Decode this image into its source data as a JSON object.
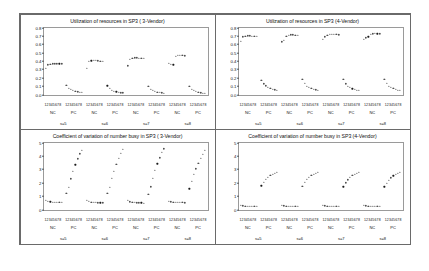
{
  "figure": {
    "background": "#ffffff",
    "frame_color": "#6a6a6a",
    "marker_color": "#1a1a1a"
  },
  "chart_data": [
    {
      "id": "top-left",
      "type": "scatter",
      "title": "Utilization of resources in SP3 ( 3-Vendor)",
      "xlabel": "",
      "ylabel": "",
      "ylim": [
        0.0,
        0.8
      ],
      "yticks": [
        "0.0",
        "0.1",
        "0.2",
        "0.3",
        "0.4",
        "0.5",
        "0.6",
        "0.7",
        "0.8"
      ],
      "grid": false,
      "legend": "none",
      "x_tick_labels": [
        "1",
        "2",
        "3",
        "4",
        "5",
        "6",
        "7",
        "8"
      ],
      "group_labels": [
        "s=5",
        "s=6",
        "s=7",
        "s=8"
      ],
      "subgroup_labels": [
        "NC",
        "PC"
      ],
      "series": [
        {
          "name": "s=5 NC",
          "values": [
            0.315,
            0.355,
            0.365,
            0.368,
            0.37,
            0.37,
            0.37,
            0.368
          ]
        },
        {
          "name": "s=5 PC",
          "values": [
            0.11,
            0.078,
            0.06,
            0.048,
            0.04,
            0.033,
            0.028,
            0.025
          ]
        },
        {
          "name": "s=6 NC",
          "values": [
            0.315,
            0.395,
            0.405,
            0.408,
            0.408,
            0.405,
            0.4,
            0.398
          ]
        },
        {
          "name": "s=6 PC",
          "values": [
            0.105,
            0.072,
            0.055,
            0.043,
            0.035,
            0.029,
            0.024,
            0.021
          ]
        },
        {
          "name": "s=7 NC",
          "values": [
            0.345,
            0.425,
            0.438,
            0.44,
            0.44,
            0.438,
            0.435,
            0.432
          ]
        },
        {
          "name": "s=7 PC",
          "values": [
            0.1,
            0.068,
            0.05,
            0.039,
            0.031,
            0.026,
            0.022,
            0.019
          ]
        },
        {
          "name": "s=8 NC",
          "values": [
            0.375,
            0.362,
            0.358,
            0.46,
            0.468,
            0.47,
            0.468,
            0.465
          ]
        },
        {
          "name": "s=8 PC",
          "values": [
            0.098,
            0.065,
            0.048,
            0.037,
            0.029,
            0.024,
            0.02,
            0.017
          ]
        }
      ]
    },
    {
      "id": "top-right",
      "type": "scatter",
      "title": "Utilization of resources in SP3 (4-Vendor)",
      "xlabel": "",
      "ylabel": "",
      "ylim": [
        0.0,
        0.8
      ],
      "yticks": [
        "0.0",
        "0.1",
        "0.2",
        "0.3",
        "0.4",
        "0.5",
        "0.6",
        "0.7",
        "0.8"
      ],
      "grid": false,
      "legend": "none",
      "x_tick_labels": [
        "1",
        "2",
        "3",
        "4",
        "5",
        "6",
        "7",
        "8"
      ],
      "group_labels": [
        "s=5",
        "s=6",
        "s=7",
        "s=8"
      ],
      "subgroup_labels": [
        "NC",
        "PC"
      ],
      "series": [
        {
          "name": "s=5 NC",
          "values": [
            0.64,
            0.69,
            0.7,
            0.702,
            0.702,
            0.7,
            0.698,
            0.696
          ]
        },
        {
          "name": "s=5 PC",
          "values": [
            0.175,
            0.13,
            0.105,
            0.088,
            0.075,
            0.066,
            0.059,
            0.054
          ]
        },
        {
          "name": "s=6 NC",
          "values": [
            0.63,
            0.645,
            0.7,
            0.712,
            0.715,
            0.715,
            0.712,
            0.71
          ]
        },
        {
          "name": "s=6 PC",
          "values": [
            0.18,
            0.132,
            0.104,
            0.086,
            0.073,
            0.064,
            0.057,
            0.052
          ]
        },
        {
          "name": "s=7 NC",
          "values": [
            0.665,
            0.69,
            0.712,
            0.718,
            0.72,
            0.72,
            0.718,
            0.716
          ]
        },
        {
          "name": "s=7 PC",
          "values": [
            0.18,
            0.13,
            0.102,
            0.084,
            0.071,
            0.062,
            0.055,
            0.05
          ]
        },
        {
          "name": "s=8 NC",
          "values": [
            0.66,
            0.678,
            0.69,
            0.72,
            0.728,
            0.73,
            0.728,
            0.726
          ]
        },
        {
          "name": "s=8 PC",
          "values": [
            0.185,
            0.133,
            0.104,
            0.085,
            0.072,
            0.063,
            0.056,
            0.051
          ]
        }
      ]
    },
    {
      "id": "bottom-left",
      "type": "scatter",
      "title": "Coefficient of variation of number busy in SP3 ( 3-Vendor)",
      "xlabel": "",
      "ylabel": "",
      "ylim": [
        0,
        5
      ],
      "yticks": [
        "0",
        "1",
        "2",
        "3",
        "4",
        "5"
      ],
      "grid": false,
      "legend": "none",
      "x_tick_labels": [
        "1",
        "2",
        "3",
        "4",
        "5",
        "6",
        "7",
        "8"
      ],
      "group_labels": [
        "s=5",
        "s=6",
        "s=7",
        "s=8"
      ],
      "subgroup_labels": [
        "NC",
        "PC"
      ],
      "series": [
        {
          "name": "s=5 NC",
          "values": [
            0.72,
            0.62,
            0.58,
            0.56,
            0.55,
            0.54,
            0.53,
            0.53
          ]
        },
        {
          "name": "s=5 PC",
          "values": [
            1.2,
            1.65,
            2.3,
            2.85,
            3.35,
            3.8,
            4.18,
            4.45
          ]
        },
        {
          "name": "s=6 NC",
          "values": [
            0.7,
            0.6,
            0.56,
            0.54,
            0.53,
            0.52,
            0.52,
            0.51
          ]
        },
        {
          "name": "s=6 PC",
          "values": [
            1.2,
            1.68,
            2.32,
            2.88,
            3.38,
            3.82,
            4.2,
            4.48
          ]
        },
        {
          "name": "s=7 NC",
          "values": [
            0.68,
            0.58,
            0.55,
            0.53,
            0.52,
            0.51,
            0.51,
            0.5
          ]
        },
        {
          "name": "s=7 PC",
          "values": [
            1.15,
            1.7,
            2.35,
            2.92,
            3.42,
            3.88,
            4.28,
            4.55
          ]
        },
        {
          "name": "s=8 NC",
          "values": [
            0.62,
            0.58,
            0.55,
            0.53,
            0.56,
            0.54,
            0.53,
            0.52
          ]
        },
        {
          "name": "s=8 PC",
          "values": [
            1.55,
            2.12,
            2.62,
            3.05,
            3.45,
            3.82,
            4.15,
            4.42
          ]
        }
      ]
    },
    {
      "id": "bottom-right",
      "type": "scatter",
      "title": "Coefficient of variation of number busy in SP3 (4-Vendor)",
      "xlabel": "",
      "ylabel": "",
      "ylim": [
        0,
        5
      ],
      "yticks": [
        "0",
        "1",
        "2",
        "3",
        "4",
        "5"
      ],
      "grid": false,
      "legend": "none",
      "x_tick_labels": [
        "1",
        "2",
        "3",
        "4",
        "5",
        "6",
        "7",
        "8"
      ],
      "group_labels": [
        "s=5",
        "s=6",
        "s=7",
        "s=8"
      ],
      "subgroup_labels": [
        "NC",
        "PC"
      ],
      "series": [
        {
          "name": "s=5 NC",
          "values": [
            0.32,
            0.28,
            0.26,
            0.25,
            0.24,
            0.24,
            0.23,
            0.23
          ]
        },
        {
          "name": "s=5 PC",
          "values": [
            1.78,
            2.05,
            2.25,
            2.42,
            2.55,
            2.65,
            2.72,
            2.78
          ]
        },
        {
          "name": "s=6 NC",
          "values": [
            0.33,
            0.28,
            0.26,
            0.25,
            0.24,
            0.24,
            0.23,
            0.23
          ]
        },
        {
          "name": "s=6 PC",
          "values": [
            1.75,
            2.02,
            2.24,
            2.4,
            2.54,
            2.64,
            2.72,
            2.78
          ]
        },
        {
          "name": "s=7 NC",
          "values": [
            0.34,
            0.29,
            0.27,
            0.26,
            0.25,
            0.24,
            0.24,
            0.23
          ]
        },
        {
          "name": "s=7 PC",
          "values": [
            1.7,
            2.0,
            2.22,
            2.4,
            2.54,
            2.64,
            2.72,
            2.78
          ]
        },
        {
          "name": "s=8 NC",
          "values": [
            0.33,
            0.28,
            0.26,
            0.25,
            0.24,
            0.24,
            0.23,
            0.23
          ]
        },
        {
          "name": "s=8 PC",
          "values": [
            1.7,
            1.98,
            2.2,
            2.38,
            2.52,
            2.63,
            2.72,
            2.8
          ]
        }
      ]
    }
  ]
}
